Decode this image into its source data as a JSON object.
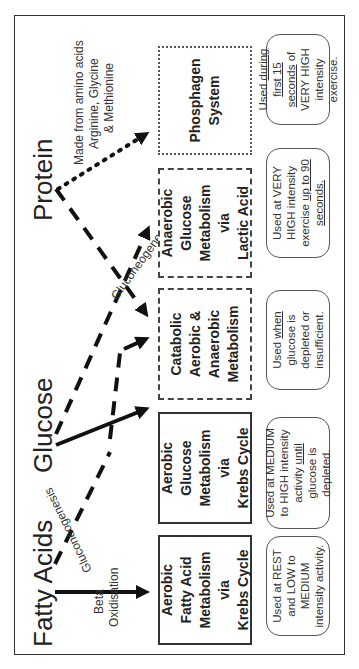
{
  "diagram": {
    "orientation": "rotated-90-ccw",
    "sources": [
      {
        "id": "fatty-acids",
        "label": "Fatty Acids"
      },
      {
        "id": "glucose",
        "label": "Glucose"
      },
      {
        "id": "protein",
        "label": "Protein"
      }
    ],
    "arrow_labels": {
      "beta_oxidisation_1": "Beta",
      "beta_oxidisation_2": "Oxidisation",
      "gluconeogenesis_fatty": "Gluconeogenesis",
      "gluconeogenesis_protein": "Gluconeogenesis",
      "amino_1": "Made from amino acids",
      "amino_2": "Arginine, Glycine",
      "amino_3": "& Methionine"
    },
    "systems": [
      {
        "id": "aerobic-fatty-acid",
        "lines": [
          "Aerobic",
          "Fatty Acid",
          "Metabolism",
          "via",
          "Krebs Cycle"
        ],
        "border": "solid",
        "note": {
          "pre": "Used at REST and LOW to MEDIUM intensity activity.",
          "underlined": "",
          "post": ""
        }
      },
      {
        "id": "aerobic-glucose",
        "lines": [
          "Aerobic",
          "Glucose",
          "Metabolism",
          "via",
          "Krebs Cycle"
        ],
        "border": "solid",
        "note": {
          "pre": "Used at MEDIUM to HIGH intensity activity ",
          "underlined": "until",
          "post": " glucose is depleted."
        }
      },
      {
        "id": "catabolic",
        "lines": [
          "Catabolic",
          "Aerobic &",
          "Anaerobic",
          "Metabolism"
        ],
        "border": "dashed",
        "note": {
          "pre": "Used ",
          "underlined": "when",
          "post": " glucose is depleted or insufficient."
        }
      },
      {
        "id": "anaerobic-glucose",
        "lines": [
          "Anaerobic",
          "Glucose",
          "Metabolism",
          "via",
          "Lactic Acid"
        ],
        "border": "dashed",
        "note": {
          "pre": "Used at VERY HIGH intensity exercise ",
          "underlined": "up to 90 seconds.",
          "post": ""
        }
      },
      {
        "id": "phosphagen",
        "lines": [
          "Phosphagen",
          "System"
        ],
        "border": "dotted",
        "note": {
          "pre": "Used ",
          "underlined": "during first 15 seconds",
          "post": " of VERY HIGH intensity exercise."
        }
      }
    ],
    "edges": [
      {
        "from": "fatty-acids",
        "to": "aerobic-fatty-acid",
        "style": "solid",
        "label": "Beta Oxidisation"
      },
      {
        "from": "fatty-acids",
        "to": "glucose",
        "style": "dashed",
        "label": "Gluconeogenesis"
      },
      {
        "from": "glucose",
        "to": "aerobic-glucose",
        "style": "solid"
      },
      {
        "from": "glucose",
        "to": "anaerobic-glucose",
        "style": "dashed"
      },
      {
        "from": "glucose",
        "to": "catabolic",
        "style": "dashed"
      },
      {
        "from": "protein",
        "to": "catabolic",
        "style": "dashed",
        "label": "Gluconeogenesis"
      },
      {
        "from": "protein",
        "to": "phosphagen",
        "style": "dotted",
        "label": "Made from amino acids Arginine, Glycine & Methionine"
      }
    ]
  }
}
